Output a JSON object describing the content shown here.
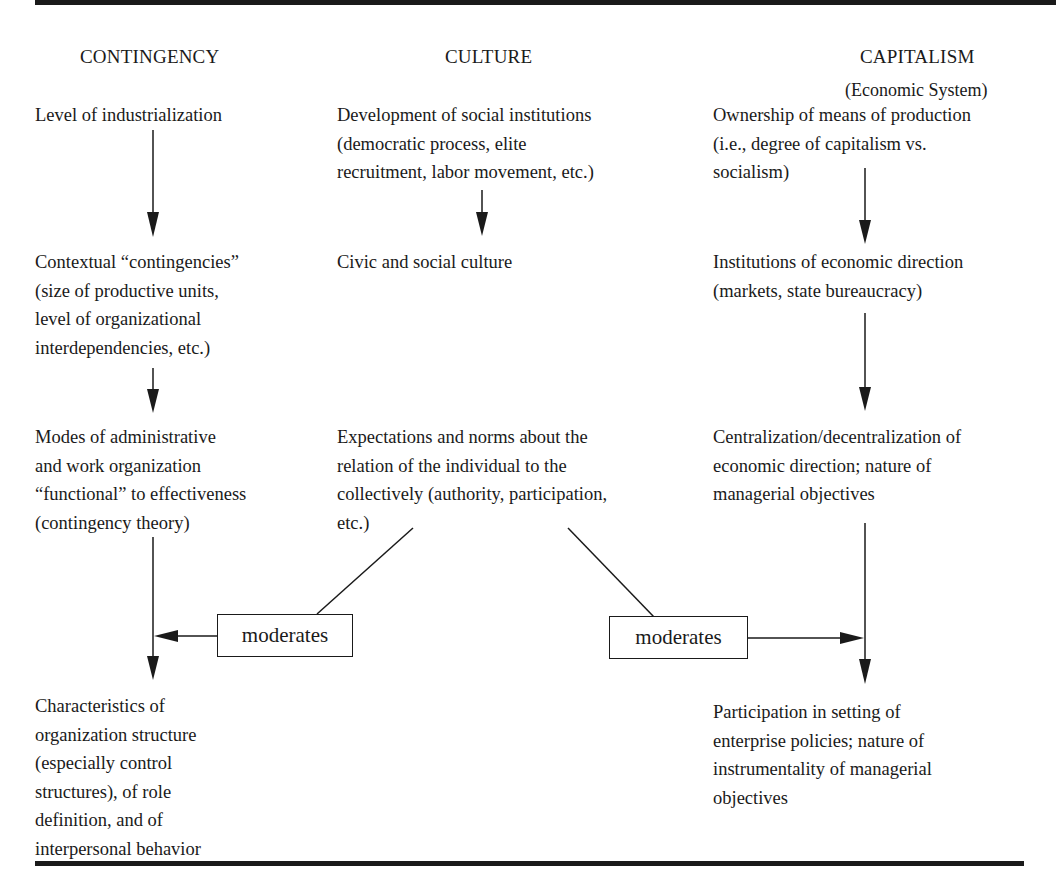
{
  "columns": {
    "contingency": {
      "header": "CONTINGENCY",
      "nodes": [
        {
          "lines": [
            "Level of industrialization"
          ]
        },
        {
          "lines": [
            "Contextual “contingencies”",
            "(size of productive units,",
            "level of organizational",
            "interdependencies, etc.)"
          ]
        },
        {
          "lines": [
            "Modes of administrative",
            "and work organization",
            "“functional” to effectiveness",
            "(contingency theory)"
          ]
        },
        {
          "lines": [
            "Characteristics of",
            "organization structure",
            "(especially control",
            "structures), of role",
            "definition, and of",
            "interpersonal behavior"
          ]
        }
      ]
    },
    "culture": {
      "header": "CULTURE",
      "nodes": [
        {
          "lines": [
            "Development of social institutions",
            "(democratic process, elite",
            "recruitment, labor movement, etc.)"
          ]
        },
        {
          "lines": [
            "Civic and social culture"
          ]
        },
        {
          "lines": [
            "Expectations and norms about the",
            "relation of the individual to the",
            "collectively (authority, participation,",
            "etc.)"
          ]
        }
      ]
    },
    "capitalism": {
      "header": "CAPITALISM",
      "subheader": "(Economic System)",
      "nodes": [
        {
          "lines": [
            "Ownership of means of production",
            "(i.e., degree of capitalism vs.",
            "socialism)"
          ]
        },
        {
          "lines": [
            "Institutions of economic direction",
            "(markets, state bureaucracy)"
          ]
        },
        {
          "lines": [
            "Centralization/decentralization of",
            "economic direction; nature of",
            "managerial objectives"
          ]
        },
        {
          "lines": [
            "Participation in setting of",
            "enterprise policies; nature of",
            "instrumentality of managerial",
            "objectives"
          ]
        }
      ]
    }
  },
  "moderators": {
    "left": "moderates",
    "right": "moderates"
  },
  "colors": {
    "ink": "#1a1a1a",
    "background": "#ffffff"
  }
}
